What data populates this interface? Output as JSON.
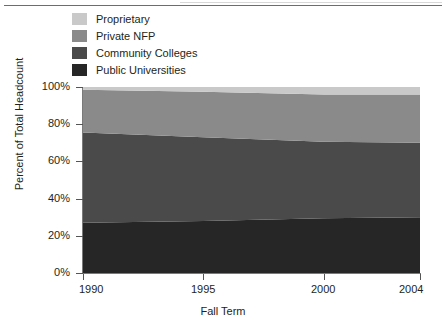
{
  "chart_data": {
    "type": "area",
    "stacked": true,
    "percent_stacked": true,
    "title": "",
    "xlabel": "Fall Term",
    "ylabel": "Percent of Total Headcount",
    "x": [
      1990,
      1995,
      2000,
      2004
    ],
    "xlim": [
      1990,
      2004
    ],
    "ylim": [
      0,
      100
    ],
    "yticks": [
      0,
      20,
      40,
      60,
      80,
      100
    ],
    "ytick_labels": [
      "0%",
      "20%",
      "40%",
      "60%",
      "80%",
      "100%"
    ],
    "xticks": [
      1990,
      1995,
      2000,
      2004
    ],
    "xtick_labels": [
      "1990",
      "1995",
      "2000",
      "2004"
    ],
    "grid": false,
    "legend_position": "top-left",
    "series": [
      {
        "name": "Public Universities",
        "color": "#262626",
        "values": [
          27.0,
          28.0,
          29.5,
          30.0
        ]
      },
      {
        "name": "Community Colleges",
        "color": "#4a4a4a",
        "values": [
          48.5,
          45.0,
          41.0,
          40.0
        ]
      },
      {
        "name": "Private NFP",
        "color": "#8a8a8a",
        "values": [
          23.0,
          24.5,
          25.5,
          26.0
        ]
      },
      {
        "name": "Proprietary",
        "color": "#c9c9c9",
        "values": [
          1.5,
          2.5,
          4.0,
          4.0
        ]
      }
    ]
  },
  "legend": {
    "items": [
      {
        "label": "Proprietary",
        "color": "#c9c9c9"
      },
      {
        "label": "Private NFP",
        "color": "#8a8a8a"
      },
      {
        "label": "Community Colleges",
        "color": "#4a4a4a"
      },
      {
        "label": "Public Universities",
        "color": "#262626"
      }
    ]
  },
  "axes": {
    "y_title": "Percent of Total Headcount",
    "x_title": "Fall Term",
    "y_labels": [
      "100%",
      "80%",
      "60%",
      "40%",
      "20%",
      "0%"
    ],
    "x_labels": [
      "1990",
      "1995",
      "2000",
      "2004"
    ]
  }
}
